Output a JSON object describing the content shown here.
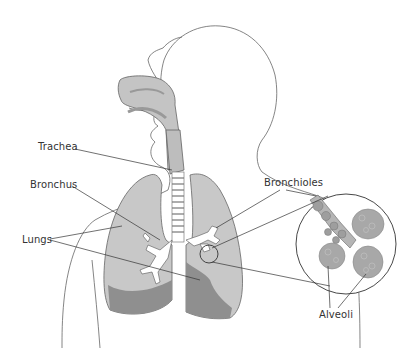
{
  "diagram": {
    "labels": {
      "trachea": "Trachea",
      "bronchus": "Bronchus",
      "lungs": "Lungs",
      "bronchioles": "Bronchioles",
      "alveoli": "Alveoli"
    },
    "colors": {
      "outline": "#555555",
      "lung_light": "#c8c8c8",
      "lung_dark": "#8f8f8f",
      "airway_fill": "#bdbdbd",
      "alveoli": "#a8a8a8",
      "leader_line": "#333333",
      "background": "#ffffff"
    }
  }
}
